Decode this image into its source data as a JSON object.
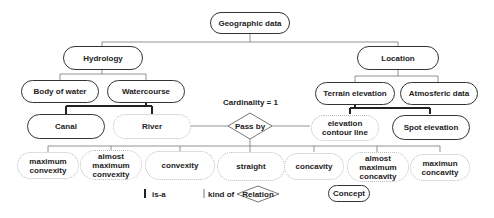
{
  "diagram": {
    "root": {
      "label": "Geographic data"
    },
    "level1": [
      {
        "label": "Hydrology"
      },
      {
        "label": "Location"
      }
    ],
    "level2": [
      {
        "label": "Body of water",
        "parent": "Hydrology"
      },
      {
        "label": "Watercourse",
        "parent": "Hydrology"
      },
      {
        "label": "Terrain elevation",
        "parent": "Location"
      },
      {
        "label": "Atmosferic data",
        "parent": "Location"
      }
    ],
    "level3": [
      {
        "label": "Canal",
        "parent": "Watercourse",
        "link": "is-a"
      },
      {
        "label": "River",
        "parent": "Watercourse",
        "link": "kind of"
      },
      {
        "label": "elevation contour line",
        "parent": "Terrain elevation",
        "link": "kind of"
      },
      {
        "label": "Spot elevation",
        "parent": "Terrain elevation",
        "link": "is-a"
      }
    ],
    "relation": {
      "label": "Pass by",
      "cardinality": "Cardinality = 1",
      "from": "River",
      "to": "elevation contour line"
    },
    "level4": [
      {
        "label": "maximum convexity"
      },
      {
        "label": "almost maximum convexity"
      },
      {
        "label": "convexity"
      },
      {
        "label": "straight"
      },
      {
        "label": "concavity"
      },
      {
        "label": "almost maximum concavity"
      },
      {
        "label": "maximun concavity"
      }
    ],
    "legend": {
      "is_a": "is-a",
      "kind_of": "kind of",
      "relation": "Relation",
      "concept": "Concept"
    }
  }
}
